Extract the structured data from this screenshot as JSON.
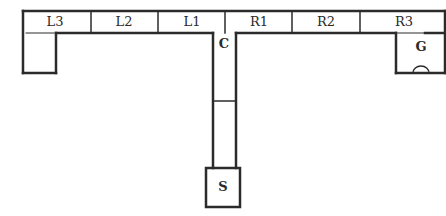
{
  "diagram": {
    "type": "floor-plan-maze",
    "line_color": "#2b2b2b",
    "corridor_segments": [
      {
        "label": "L3"
      },
      {
        "label": "L2"
      },
      {
        "label": "L1"
      },
      {
        "label": "R1"
      },
      {
        "label": "R2"
      },
      {
        "label": "R3"
      }
    ],
    "junction_label": "C",
    "start_label": "S",
    "goal_label": "G"
  }
}
